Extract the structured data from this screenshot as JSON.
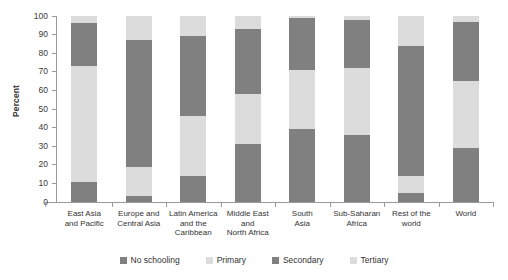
{
  "chart_data": {
    "type": "bar",
    "subtype": "stacked-bar-100-percent",
    "title": "",
    "xlabel": "",
    "ylabel": "Percent",
    "ylim": [
      0,
      100
    ],
    "yticks": [
      0,
      10,
      20,
      30,
      40,
      50,
      60,
      70,
      80,
      90,
      100
    ],
    "grid": false,
    "legend_position": "bottom",
    "categories": [
      "East Asia\nand Pacific",
      "Europe and\nCentral Asia",
      "Latin America\nand the\nCaribbean",
      "Middle East\nand\nNorth Africa",
      "South\nAsia",
      "Sub-Saharan\nAfrica",
      "Rest of the\nworld",
      "World"
    ],
    "series": [
      {
        "name": "No schooling",
        "color": "#808080",
        "values": [
          11,
          3.5,
          14,
          31,
          39,
          36,
          5,
          29
        ]
      },
      {
        "name": "Primary",
        "color": "#dcdcdc",
        "values": [
          62,
          15.5,
          32,
          27,
          32,
          36,
          9,
          36
        ]
      },
      {
        "name": "Secondary",
        "color": "#808080",
        "values": [
          23,
          68,
          43,
          35,
          28,
          26,
          70,
          32
        ]
      },
      {
        "name": "Tertiary",
        "color": "#dcdcdc",
        "values": [
          4,
          13,
          11,
          7,
          1,
          2,
          16,
          3
        ]
      }
    ],
    "cumulative_tops": [
      [
        11,
        73,
        96,
        100
      ],
      [
        3.5,
        19,
        87,
        100
      ],
      [
        14,
        46,
        89,
        100
      ],
      [
        31,
        58,
        93,
        100
      ],
      [
        39,
        71,
        99,
        100
      ],
      [
        36,
        72,
        98,
        100
      ],
      [
        5,
        14,
        84,
        100
      ],
      [
        29,
        65,
        97,
        100
      ]
    ]
  },
  "legend": {
    "items": [
      {
        "label": "No schooling",
        "color": "#808080"
      },
      {
        "label": "Primary",
        "color": "#dcdcdc"
      },
      {
        "label": "Secondary",
        "color": "#808080"
      },
      {
        "label": "Tertiary",
        "color": "#dcdcdc"
      }
    ]
  },
  "colors": {
    "dark_gray": "#808080",
    "light_gray": "#dcdcdc",
    "axis": "#9a9a9a",
    "text": "#333333",
    "background": "#ffffff"
  }
}
